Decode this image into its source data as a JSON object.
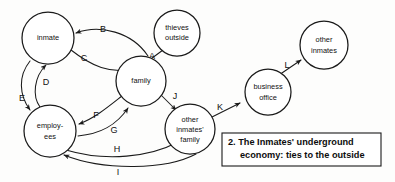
{
  "diagram": {
    "type": "node-link-diagram",
    "caption": {
      "line1": "2. The Inmates' underground",
      "line2": "economy: ties to the outside"
    },
    "nodes": [
      {
        "id": "inmate",
        "lines": [
          "inmate"
        ],
        "cx": 48,
        "cy": 38,
        "r": 26
      },
      {
        "id": "thieves-outside",
        "lines": [
          "thieves",
          "outside"
        ],
        "cx": 177,
        "cy": 33,
        "r": 23
      },
      {
        "id": "family",
        "lines": [
          "family"
        ],
        "cx": 141,
        "cy": 81,
        "r": 25
      },
      {
        "id": "employees",
        "lines": [
          "employ-",
          "ees"
        ],
        "cx": 50,
        "cy": 131,
        "r": 26
      },
      {
        "id": "other-inmates-family",
        "lines": [
          "other",
          "inmates'",
          "family"
        ],
        "cx": 190,
        "cy": 129,
        "r": 25
      },
      {
        "id": "business-office",
        "lines": [
          "business",
          "office"
        ],
        "cx": 268,
        "cy": 92,
        "r": 23
      },
      {
        "id": "other-inmates",
        "lines": [
          "other",
          "inmates"
        ],
        "cx": 324,
        "cy": 45,
        "r": 24
      }
    ],
    "edges": [
      {
        "id": "A",
        "label": "A",
        "from": "thieves-outside",
        "to": "family",
        "lx": 152,
        "ly": 57
      },
      {
        "id": "B",
        "label": "B",
        "from": "family",
        "to": "inmate",
        "lx": 103,
        "ly": 32
      },
      {
        "id": "C",
        "label": "C",
        "from": "inmate",
        "to": "family",
        "lx": 84,
        "ly": 58
      },
      {
        "id": "D",
        "label": "D",
        "from": "employees",
        "to": "inmate",
        "lx": 45,
        "ly": 83
      },
      {
        "id": "E",
        "label": "E",
        "from": "inmate",
        "to": "employees",
        "lx": 23,
        "ly": 99
      },
      {
        "id": "F",
        "label": "F",
        "from": "family",
        "to": "employees",
        "lx": 95,
        "ly": 117
      },
      {
        "id": "G",
        "label": "G",
        "from": "employees",
        "to": "family",
        "lx": 113,
        "ly": 130
      },
      {
        "id": "H",
        "label": "H",
        "from": "employees",
        "to": "other-inmates-family",
        "lx": 116,
        "ly": 151
      },
      {
        "id": "I",
        "label": "I",
        "from": "other-inmates-family",
        "to": "employees",
        "lx": 118,
        "ly": 172
      },
      {
        "id": "J",
        "label": "J",
        "from": "family",
        "to": "other-inmates-family",
        "lx": 174,
        "ly": 98
      },
      {
        "id": "K",
        "label": "K",
        "from": "other-inmates-family",
        "to": "business-office",
        "lx": 222,
        "ly": 110
      },
      {
        "id": "L",
        "label": "L",
        "from": "business-office",
        "to": "other-inmates",
        "lx": 288,
        "ly": 68
      }
    ]
  }
}
